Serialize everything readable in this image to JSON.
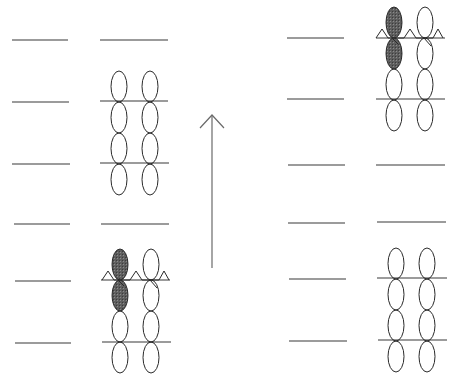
{
  "diagram": {
    "title": "",
    "colors": {
      "line": "#7a7a7a",
      "ellipse_stroke": "#2a2a2a",
      "shaded_fill": "#5e5e5e",
      "arrow": "#6a6a6a",
      "background": "#ffffff"
    },
    "arrow": {
      "direction": "up",
      "x": 212,
      "y_top": 115,
      "y_bottom": 268
    },
    "panels": [
      {
        "name": "top-left",
        "left_lines": [
          {
            "x1": 12,
            "x2": 68,
            "y": 40
          },
          {
            "x1": 12,
            "x2": 69,
            "y": 102
          },
          {
            "x1": 12,
            "x2": 70,
            "y": 164
          }
        ],
        "right_lines": [
          {
            "x1": 100,
            "x2": 168,
            "y": 40
          },
          {
            "x1": 100,
            "x2": 168,
            "y": 101
          },
          {
            "x1": 100,
            "x2": 169,
            "y": 163
          }
        ],
        "columns": [
          119,
          150
        ],
        "ellipse_top": 71,
        "shaded": false
      },
      {
        "name": "bottom-left",
        "left_lines": [
          {
            "x1": 14,
            "x2": 70,
            "y": 224
          },
          {
            "x1": 15,
            "x2": 71,
            "y": 281
          },
          {
            "x1": 15,
            "x2": 71,
            "y": 343
          }
        ],
        "right_lines": [
          {
            "x1": 101,
            "x2": 169,
            "y": 224
          },
          {
            "x1": 101,
            "x2": 170,
            "y": 280
          },
          {
            "x1": 102,
            "x2": 171,
            "y": 342
          }
        ],
        "columns": [
          120,
          151
        ],
        "ellipse_top": 249,
        "shaded": true
      },
      {
        "name": "top-right",
        "left_lines": [
          {
            "x1": 287,
            "x2": 344,
            "y": 38
          },
          {
            "x1": 287,
            "x2": 344,
            "y": 99
          },
          {
            "x1": 288,
            "x2": 345,
            "y": 165
          }
        ],
        "right_lines": [
          {
            "x1": 376,
            "x2": 445,
            "y": 38
          },
          {
            "x1": 376,
            "x2": 445,
            "y": 99
          },
          {
            "x1": 376,
            "x2": 445,
            "y": 165
          }
        ],
        "columns": [
          394,
          425
        ],
        "ellipse_top": 7,
        "shaded": true
      },
      {
        "name": "bottom-right",
        "left_lines": [
          {
            "x1": 288,
            "x2": 345,
            "y": 223
          },
          {
            "x1": 289,
            "x2": 346,
            "y": 279
          },
          {
            "x1": 289,
            "x2": 347,
            "y": 341
          }
        ],
        "right_lines": [
          {
            "x1": 377,
            "x2": 446,
            "y": 222
          },
          {
            "x1": 377,
            "x2": 447,
            "y": 278
          },
          {
            "x1": 378,
            "x2": 447,
            "y": 340
          }
        ],
        "columns": [
          396,
          427
        ],
        "ellipse_top": 248,
        "shaded": false
      }
    ]
  }
}
